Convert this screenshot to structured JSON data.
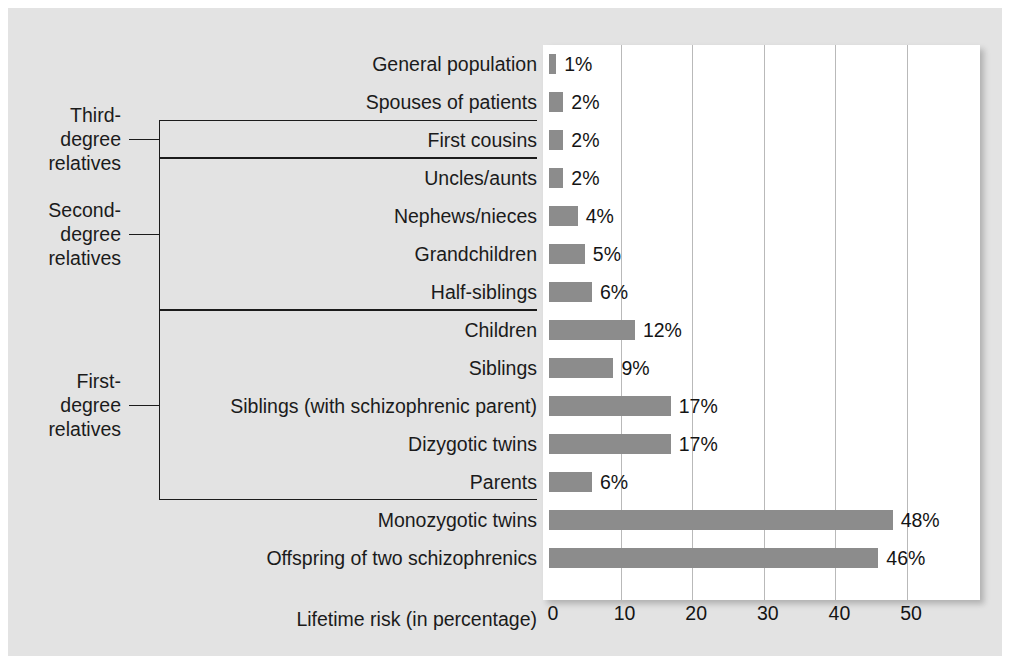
{
  "chart_data": {
    "type": "bar",
    "orientation": "horizontal",
    "title": "",
    "xlabel": "Lifetime risk (in percentage)",
    "ylabel": "",
    "xlim": [
      0,
      60
    ],
    "xticks": [
      0,
      10,
      20,
      30,
      40,
      50
    ],
    "xtick_labels": [
      "0",
      "10",
      "20",
      "30",
      "40",
      "50"
    ],
    "grid": "vertical",
    "legend": "none",
    "bar_color": "#8c8c8c",
    "panel_color": "#e3e3e3",
    "plot_bg": "#ffffff",
    "categories": [
      "General population",
      "Spouses of patients",
      "First cousins",
      "Uncles/aunts",
      "Nephews/nieces",
      "Grandchildren",
      "Half-siblings",
      "Children",
      "Siblings",
      "Siblings (with schizophrenic parent)",
      "Dizygotic twins",
      "Parents",
      "Monozygotic twins",
      "Offspring of two schizophrenics"
    ],
    "values": [
      1,
      2,
      2,
      2,
      4,
      5,
      6,
      12,
      9,
      17,
      17,
      6,
      48,
      46
    ],
    "value_labels": [
      "1%",
      "2%",
      "2%",
      "2%",
      "4%",
      "5%",
      "6%",
      "12%",
      "9%",
      "17%",
      "17%",
      "6%",
      "48%",
      "46%"
    ],
    "groups": [
      {
        "label_lines": [
          "Third-",
          "degree",
          "relatives"
        ],
        "from": 2,
        "to": 2
      },
      {
        "label_lines": [
          "Second-",
          "degree",
          "relatives"
        ],
        "from": 3,
        "to": 6
      },
      {
        "label_lines": [
          "First-",
          "degree",
          "relatives"
        ],
        "from": 7,
        "to": 11
      }
    ]
  }
}
